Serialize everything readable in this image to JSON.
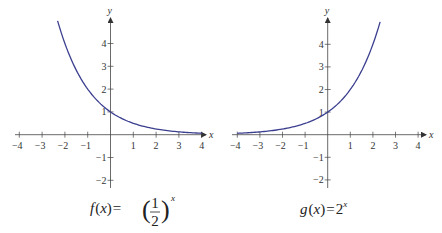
{
  "chart_data": [
    {
      "type": "line",
      "title": "f(x) = (1/2)^x",
      "caption": {
        "fname": "f",
        "var": "x",
        "num": "1",
        "den": "2",
        "exp": "x"
      },
      "xlabel": "x",
      "ylabel": "y",
      "xlim": [
        -4,
        4
      ],
      "ylim": [
        -2,
        5
      ],
      "x_ticks": [
        -4,
        -3,
        -2,
        -1,
        1,
        2,
        3,
        4
      ],
      "y_ticks": [
        -2,
        -1,
        1,
        2,
        3,
        4
      ],
      "grid": false,
      "series": [
        {
          "name": "f(x) = (1/2)^x",
          "base": 0.5,
          "x_range": [
            -2.32,
            4
          ],
          "color": "#3b3f8f"
        }
      ],
      "x": [
        -2,
        -1,
        0,
        1,
        2,
        3,
        4
      ],
      "values": [
        4,
        2,
        1,
        0.5,
        0.25,
        0.125,
        0.0625
      ]
    },
    {
      "type": "line",
      "title": "g(x) = 2^x",
      "caption": {
        "fname": "g",
        "var": "x",
        "base": "2",
        "exp": "x"
      },
      "xlabel": "x",
      "ylabel": "y",
      "xlim": [
        -4,
        4
      ],
      "ylim": [
        -2,
        5
      ],
      "x_ticks": [
        -4,
        -3,
        -2,
        -1,
        1,
        2,
        3,
        4
      ],
      "y_ticks": [
        -2,
        -1,
        1,
        2,
        3,
        4
      ],
      "grid": false,
      "series": [
        {
          "name": "g(x) = 2^x",
          "base": 2,
          "x_range": [
            -4,
            2.32
          ],
          "color": "#3b3f8f"
        }
      ],
      "x": [
        -4,
        -3,
        -2,
        -1,
        0,
        1,
        2
      ],
      "values": [
        0.0625,
        0.125,
        0.25,
        0.5,
        1,
        2,
        4
      ]
    }
  ],
  "layout": {
    "panels": [
      {
        "origin_x": 110.5,
        "origin_y": 134.7,
        "unit": 22.8,
        "axis_x_start": 15,
        "axis_x_end": 206,
        "axis_y_top": 18,
        "axis_y_bottom": 188,
        "caption_x": 150,
        "caption_y": 213
      },
      {
        "origin_x": 327.7,
        "origin_y": 134.7,
        "unit": 22.6,
        "axis_x_start": 232,
        "axis_x_end": 426,
        "axis_y_top": 18,
        "axis_y_bottom": 188,
        "caption_x": 327,
        "caption_y": 213
      }
    ],
    "axis_color": "#444444",
    "curve_color": "#3b3f8f"
  }
}
